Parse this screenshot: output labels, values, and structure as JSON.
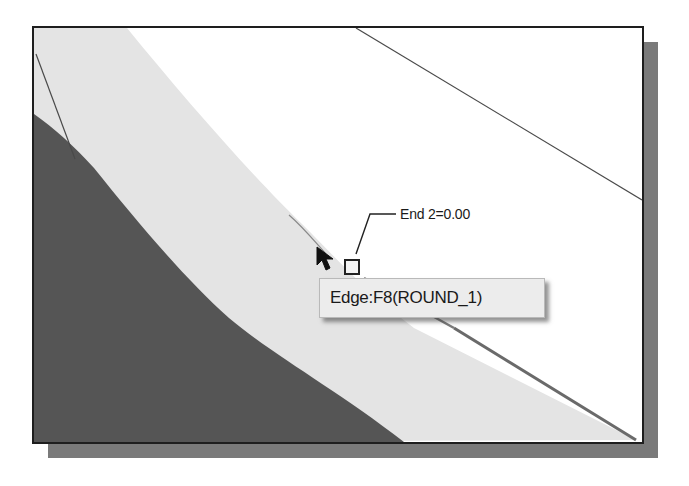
{
  "viewport": {
    "colors": {
      "background": "#ffffff",
      "light_surface": "#e4e4e4",
      "dark_surface": "#555555",
      "frame_border": "#1e1e1e",
      "frame_shadow": "#7a7a7a",
      "edge_line": "#6a6a6a"
    }
  },
  "callout": {
    "label": "End 2=0.00",
    "marker": "square-end-marker"
  },
  "tooltip": {
    "text": "Edge:F8(ROUND_1)"
  },
  "cursor": {
    "icon": "arrow-pointer-icon"
  }
}
